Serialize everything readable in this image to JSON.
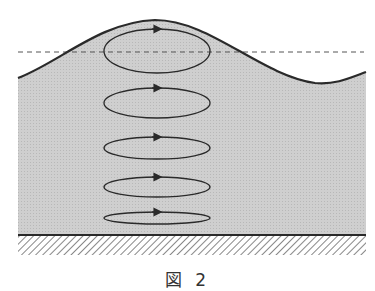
{
  "figure": {
    "caption": "図 2",
    "colors": {
      "water_fill": "#c9c9c9",
      "line": "#2a2a2a",
      "dashed_line": "#555555",
      "background": "#ffffff"
    },
    "elements": {
      "wave_surface": "wave-surface",
      "still_water_level": "dashed-still-water-level",
      "seabed": "hatched-seabed",
      "orbits": [
        {
          "cx": 157,
          "cy": 51,
          "rx": 53,
          "ry": 22,
          "direction": "clockwise"
        },
        {
          "cx": 157,
          "cy": 103,
          "rx": 53,
          "ry": 15,
          "direction": "clockwise"
        },
        {
          "cx": 157,
          "cy": 148,
          "rx": 53,
          "ry": 11,
          "direction": "clockwise"
        },
        {
          "cx": 157,
          "cy": 187,
          "rx": 53,
          "ry": 10,
          "direction": "clockwise"
        },
        {
          "cx": 157,
          "cy": 218,
          "rx": 53,
          "ry": 6,
          "direction": "clockwise"
        }
      ]
    }
  }
}
